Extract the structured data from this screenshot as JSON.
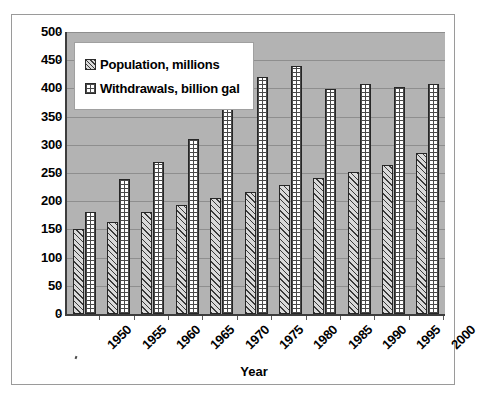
{
  "chart_data": {
    "type": "bar",
    "title": "",
    "xlabel": "Year",
    "ylabel": "",
    "categories": [
      "1950",
      "1955",
      "1960",
      "1965",
      "1970",
      "1975",
      "1980",
      "1985",
      "1990",
      "1995",
      "2000"
    ],
    "series": [
      {
        "name": "Population, millions",
        "swatch": "diagonal-hatch",
        "values": [
          151,
          164,
          180,
          194,
          206,
          217,
          228,
          242,
          251,
          265,
          285
        ]
      },
      {
        "name": "Withdrawals, billion gal",
        "swatch": "checkered",
        "values": [
          180,
          240,
          270,
          311,
          370,
          420,
          440,
          399,
          408,
          402,
          408
        ]
      }
    ],
    "ylim": [
      0,
      500
    ],
    "ytick_values": [
      0,
      50,
      100,
      150,
      200,
      250,
      300,
      350,
      400,
      450,
      500
    ],
    "ytick_labels": [
      "0",
      "50",
      "100",
      "150",
      "200",
      "250",
      "300",
      "350",
      "400",
      "450",
      "500"
    ],
    "grid": true,
    "grid_axis": "y",
    "legend_position": "upper-left-inside",
    "plot_background": "#b3b3b3",
    "figure_background": "#ffffff",
    "xtick_rotation": -45
  },
  "legend": {
    "items": [
      {
        "label": "Population, millions",
        "swatch": "diagonal-hatch-swatch"
      },
      {
        "label": "Withdrawals, billion gal",
        "swatch": "checkered-swatch"
      }
    ]
  },
  "axes": {
    "x_title": "Year"
  }
}
